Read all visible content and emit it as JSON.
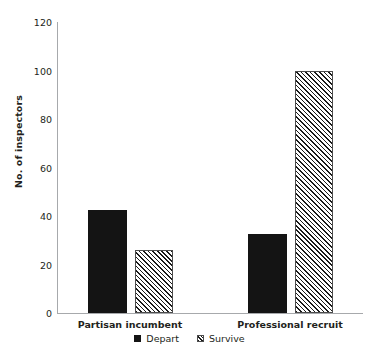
{
  "chart_data": {
    "type": "bar",
    "title": "",
    "subtitle": "",
    "xlabel": "",
    "ylabel": "No. of inspectors",
    "categories": [
      "Partisan incumbent",
      "Professional recruit"
    ],
    "series": [
      {
        "name": "Depart",
        "values": [
          42.5,
          32.5
        ]
      },
      {
        "name": "Survive",
        "values": [
          26,
          100
        ]
      }
    ],
    "ylim": [
      0,
      120
    ],
    "yticks": [
      0,
      20,
      40,
      60,
      80,
      100,
      120
    ],
    "ytick_labels": [
      "0",
      "20",
      "40",
      "60",
      "80",
      "100",
      "120"
    ],
    "grid": false,
    "legend_position": "bottom",
    "colors": {
      "depart": "#141414",
      "survive_hatch": "#1a1a1a",
      "survive_fill": "#ffffff",
      "axis": "#a7a9ac",
      "text": "#231f20",
      "background": "#ffffff"
    }
  },
  "axis": {
    "y_title": "No. of inspectors",
    "tick_0": "0",
    "tick_20": "20",
    "tick_40": "40",
    "tick_60": "60",
    "tick_80": "80",
    "tick_100": "100",
    "tick_120": "120"
  },
  "categories": {
    "cat_0": "Partisan incumbent",
    "cat_1": "Professional recruit"
  },
  "legend": {
    "depart_label": "Depart",
    "survive_label": "Survive"
  }
}
